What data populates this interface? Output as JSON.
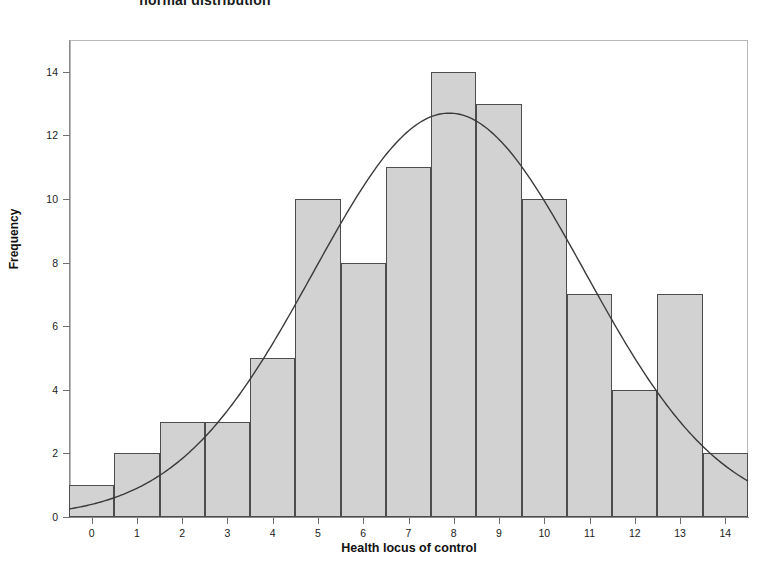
{
  "chart_data": {
    "type": "bar",
    "title": "normal distribution",
    "xlabel": "Health locus of control",
    "ylabel": "Frequency",
    "categories": [
      "0",
      "1",
      "2",
      "3",
      "4",
      "5",
      "6",
      "7",
      "8",
      "9",
      "10",
      "11",
      "12",
      "13",
      "14"
    ],
    "values": [
      1,
      2,
      3,
      3,
      5,
      10,
      8,
      11,
      14,
      13,
      10,
      7,
      4,
      7,
      2
    ],
    "ylim": [
      0,
      15
    ],
    "xlim": [
      -0.5,
      14.5
    ],
    "ytick_labels": [
      "0",
      "2",
      "4",
      "6",
      "8",
      "10",
      "12",
      "14"
    ],
    "ytick_values": [
      0,
      2,
      4,
      6,
      8,
      10,
      12,
      14
    ],
    "xtick_labels": [
      "0",
      "1",
      "2",
      "3",
      "4",
      "5",
      "6",
      "7",
      "8",
      "9",
      "10",
      "11",
      "12",
      "13",
      "14"
    ],
    "grid": false,
    "legend": "none",
    "overlay": {
      "type": "normal-curve",
      "label": "Normal curve",
      "mean": 7.9,
      "std_dev": 3.0,
      "peak_frequency": 12.7,
      "color": "#3a3a3a"
    },
    "bar_fill_color": "#d2d2d2",
    "bar_edge_color": "#4d4d4d",
    "frame_color": "#b9b9b9",
    "text_color": "#1b1b1b"
  }
}
